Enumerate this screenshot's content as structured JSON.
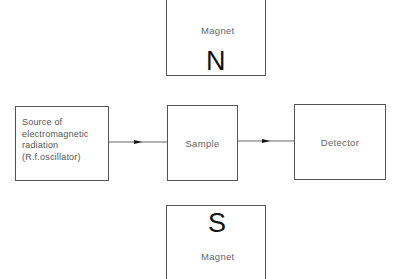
{
  "diagram": {
    "type": "block-diagram",
    "top_magnet": {
      "label": "Magnet",
      "pole": "N"
    },
    "bottom_magnet": {
      "label": "Magnet",
      "pole": "S"
    },
    "blocks": [
      {
        "id": "source",
        "label_lines": [
          "Source of",
          "electromagnetic",
          "radiation",
          "(R.f.oscillator)"
        ]
      },
      {
        "id": "sample",
        "label": "Sample"
      },
      {
        "id": "detector",
        "label": "Detector"
      }
    ],
    "connections": [
      {
        "from": "source",
        "to": "sample"
      },
      {
        "from": "sample",
        "to": "detector"
      }
    ],
    "colors": {
      "line": "#555555",
      "text": "#666666",
      "pole_text": "#111111",
      "background": "#ffffff"
    }
  }
}
